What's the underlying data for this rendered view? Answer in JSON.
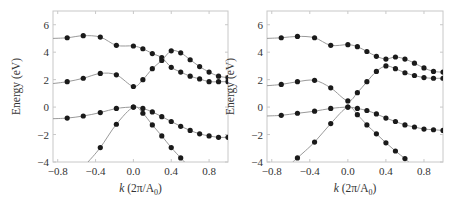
{
  "chart_data": [
    {
      "type": "line",
      "panel": "left",
      "xlabel": "k (2π/A0)",
      "ylabel": "Energy (eV)",
      "xlim": [
        -0.85,
        1.0
      ],
      "ylim": [
        -4,
        7
      ],
      "xticks": [
        -0.8,
        -0.4,
        0.0,
        0.4,
        0.8
      ],
      "xtick_labels": [
        "−0.8",
        "−0.4",
        "0.0",
        "0.4",
        "0.8"
      ],
      "yticks": [
        -4,
        -2,
        0,
        2,
        4,
        6
      ],
      "ytick_labels": [
        "−4",
        "−2",
        "0",
        "2",
        "4",
        "6"
      ],
      "grid": false,
      "series": [
        {
          "name": "band1",
          "line": [
            [
              -0.87,
              5.0
            ],
            [
              -0.7,
              5.05
            ],
            [
              -0.53,
              5.2
            ],
            [
              -0.35,
              5.1
            ],
            [
              -0.18,
              4.5
            ],
            [
              0.0,
              4.45
            ],
            [
              0.1,
              4.25
            ],
            [
              0.2,
              3.9
            ],
            [
              0.3,
              3.6
            ],
            [
              0.4,
              2.9
            ],
            [
              0.5,
              2.55
            ],
            [
              0.6,
              2.25
            ],
            [
              0.7,
              2.05
            ],
            [
              0.8,
              1.85
            ],
            [
              0.9,
              1.85
            ],
            [
              1.0,
              1.85
            ]
          ],
          "points": [
            [
              -0.7,
              5.05
            ],
            [
              -0.53,
              5.2
            ],
            [
              -0.35,
              5.1
            ],
            [
              -0.18,
              4.5
            ],
            [
              0.0,
              4.45
            ],
            [
              0.1,
              4.25
            ],
            [
              0.2,
              3.9
            ],
            [
              0.3,
              3.6
            ],
            [
              0.4,
              2.9
            ],
            [
              0.5,
              2.55
            ],
            [
              0.6,
              2.25
            ],
            [
              0.7,
              2.05
            ],
            [
              0.8,
              1.85
            ],
            [
              0.9,
              1.85
            ],
            [
              1.0,
              1.85
            ]
          ]
        },
        {
          "name": "band2",
          "line": [
            [
              -0.87,
              1.7
            ],
            [
              -0.7,
              1.85
            ],
            [
              -0.53,
              2.1
            ],
            [
              -0.35,
              2.45
            ],
            [
              -0.18,
              2.35
            ],
            [
              0.0,
              1.5
            ],
            [
              0.1,
              2.0
            ],
            [
              0.2,
              2.8
            ],
            [
              0.3,
              3.4
            ],
            [
              0.4,
              4.1
            ],
            [
              0.5,
              3.95
            ],
            [
              0.6,
              3.45
            ],
            [
              0.7,
              2.95
            ],
            [
              0.8,
              2.55
            ],
            [
              0.9,
              2.25
            ],
            [
              1.0,
              2.15
            ]
          ],
          "points": [
            [
              -0.7,
              1.85
            ],
            [
              -0.53,
              2.1
            ],
            [
              -0.35,
              2.45
            ],
            [
              -0.18,
              2.35
            ],
            [
              0.0,
              1.5
            ],
            [
              0.1,
              2.0
            ],
            [
              0.2,
              2.8
            ],
            [
              0.3,
              3.4
            ],
            [
              0.4,
              4.1
            ],
            [
              0.5,
              3.95
            ],
            [
              0.6,
              3.45
            ],
            [
              0.7,
              2.95
            ],
            [
              0.8,
              2.55
            ],
            [
              0.9,
              2.25
            ],
            [
              1.0,
              2.15
            ]
          ]
        },
        {
          "name": "band3",
          "line": [
            [
              -0.87,
              -0.85
            ],
            [
              -0.7,
              -0.8
            ],
            [
              -0.53,
              -0.65
            ],
            [
              -0.35,
              -0.4
            ],
            [
              -0.18,
              -0.1
            ],
            [
              0.0,
              0.0
            ],
            [
              0.1,
              -0.1
            ],
            [
              0.2,
              -0.35
            ],
            [
              0.3,
              -0.7
            ],
            [
              0.4,
              -1.05
            ],
            [
              0.5,
              -1.4
            ],
            [
              0.6,
              -1.7
            ],
            [
              0.7,
              -1.95
            ],
            [
              0.8,
              -2.1
            ],
            [
              0.9,
              -2.2
            ],
            [
              1.0,
              -2.2
            ]
          ],
          "points": [
            [
              -0.7,
              -0.8
            ],
            [
              -0.53,
              -0.65
            ],
            [
              -0.35,
              -0.4
            ],
            [
              -0.18,
              -0.1
            ],
            [
              0.0,
              0.0
            ],
            [
              0.1,
              -0.1
            ],
            [
              0.2,
              -0.35
            ],
            [
              0.3,
              -0.7
            ],
            [
              0.4,
              -1.05
            ],
            [
              0.5,
              -1.4
            ],
            [
              0.6,
              -1.7
            ],
            [
              0.7,
              -1.95
            ],
            [
              0.8,
              -2.1
            ],
            [
              0.9,
              -2.2
            ],
            [
              1.0,
              -2.2
            ]
          ]
        },
        {
          "name": "band4",
          "line": [
            [
              -0.48,
              -4.0
            ],
            [
              -0.35,
              -2.95
            ],
            [
              -0.18,
              -1.25
            ],
            [
              0.0,
              0.0
            ],
            [
              0.1,
              -0.45
            ],
            [
              0.2,
              -1.3
            ],
            [
              0.3,
              -2.1
            ],
            [
              0.4,
              -2.95
            ],
            [
              0.5,
              -3.7
            ],
            [
              0.54,
              -4.0
            ]
          ],
          "points": [
            [
              -0.35,
              -2.95
            ],
            [
              -0.18,
              -1.25
            ],
            [
              0.0,
              0.0
            ],
            [
              0.1,
              -0.45
            ],
            [
              0.2,
              -1.3
            ],
            [
              0.3,
              -2.1
            ],
            [
              0.4,
              -2.95
            ],
            [
              0.5,
              -3.7
            ]
          ]
        }
      ]
    },
    {
      "type": "line",
      "panel": "right",
      "xlabel": "k (2π/A0)",
      "ylabel": "Energy (eV)",
      "xlim": [
        -0.85,
        1.0
      ],
      "ylim": [
        -4,
        7
      ],
      "xticks": [
        -0.8,
        -0.4,
        0.0,
        0.4,
        0.8
      ],
      "xtick_labels": [
        "−0.8",
        "−0.4",
        "0.0",
        "0.4",
        "0.8"
      ],
      "yticks": [
        -4,
        -2,
        0,
        2,
        4,
        6
      ],
      "ytick_labels": [
        "−4",
        "−2",
        "0",
        "2",
        "4",
        "6"
      ],
      "grid": false,
      "series": [
        {
          "name": "band1",
          "line": [
            [
              -0.87,
              5.0
            ],
            [
              -0.7,
              5.05
            ],
            [
              -0.53,
              5.15
            ],
            [
              -0.35,
              5.05
            ],
            [
              -0.18,
              4.5
            ],
            [
              0.0,
              4.55
            ],
            [
              0.1,
              4.4
            ],
            [
              0.2,
              4.05
            ],
            [
              0.3,
              3.7
            ],
            [
              0.4,
              3.5
            ],
            [
              0.5,
              3.65
            ],
            [
              0.6,
              3.5
            ],
            [
              0.7,
              3.2
            ],
            [
              0.8,
              2.85
            ],
            [
              0.9,
              2.6
            ],
            [
              1.0,
              2.55
            ]
          ],
          "points": [
            [
              -0.7,
              5.05
            ],
            [
              -0.53,
              5.15
            ],
            [
              -0.35,
              5.05
            ],
            [
              -0.18,
              4.5
            ],
            [
              0.0,
              4.55
            ],
            [
              0.1,
              4.4
            ],
            [
              0.2,
              4.05
            ],
            [
              0.3,
              3.7
            ],
            [
              0.4,
              3.5
            ],
            [
              0.5,
              3.65
            ],
            [
              0.6,
              3.5
            ],
            [
              0.7,
              3.2
            ],
            [
              0.8,
              2.85
            ],
            [
              0.9,
              2.6
            ],
            [
              1.0,
              2.55
            ]
          ]
        },
        {
          "name": "band2",
          "line": [
            [
              -0.87,
              1.55
            ],
            [
              -0.7,
              1.65
            ],
            [
              -0.53,
              1.85
            ],
            [
              -0.35,
              1.95
            ],
            [
              -0.18,
              1.4
            ],
            [
              0.0,
              0.45
            ],
            [
              0.1,
              1.05
            ],
            [
              0.2,
              1.85
            ],
            [
              0.3,
              2.6
            ],
            [
              0.4,
              3.0
            ],
            [
              0.5,
              2.8
            ],
            [
              0.6,
              2.5
            ],
            [
              0.7,
              2.3
            ],
            [
              0.8,
              2.15
            ],
            [
              0.9,
              2.1
            ],
            [
              1.0,
              2.1
            ]
          ],
          "points": [
            [
              -0.7,
              1.65
            ],
            [
              -0.53,
              1.85
            ],
            [
              -0.35,
              1.95
            ],
            [
              -0.18,
              1.4
            ],
            [
              0.0,
              0.45
            ],
            [
              0.1,
              1.05
            ],
            [
              0.2,
              1.85
            ],
            [
              0.3,
              2.6
            ],
            [
              0.4,
              3.0
            ],
            [
              0.5,
              2.8
            ],
            [
              0.6,
              2.5
            ],
            [
              0.7,
              2.3
            ],
            [
              0.8,
              2.15
            ],
            [
              0.9,
              2.1
            ],
            [
              1.0,
              2.1
            ]
          ]
        },
        {
          "name": "band3",
          "line": [
            [
              -0.87,
              -0.65
            ],
            [
              -0.7,
              -0.6
            ],
            [
              -0.53,
              -0.45
            ],
            [
              -0.35,
              -0.3
            ],
            [
              -0.18,
              -0.1
            ],
            [
              0.0,
              0.0
            ],
            [
              0.1,
              -0.1
            ],
            [
              0.2,
              -0.25
            ],
            [
              0.3,
              -0.5
            ],
            [
              0.4,
              -0.8
            ],
            [
              0.5,
              -1.05
            ],
            [
              0.6,
              -1.3
            ],
            [
              0.7,
              -1.45
            ],
            [
              0.8,
              -1.6
            ],
            [
              0.9,
              -1.65
            ],
            [
              1.0,
              -1.7
            ]
          ],
          "points": [
            [
              -0.7,
              -0.6
            ],
            [
              -0.53,
              -0.45
            ],
            [
              -0.35,
              -0.3
            ],
            [
              -0.18,
              -0.1
            ],
            [
              0.0,
              0.0
            ],
            [
              0.1,
              -0.1
            ],
            [
              0.2,
              -0.25
            ],
            [
              0.3,
              -0.5
            ],
            [
              0.4,
              -0.8
            ],
            [
              0.5,
              -1.05
            ],
            [
              0.6,
              -1.3
            ],
            [
              0.7,
              -1.45
            ],
            [
              0.8,
              -1.6
            ],
            [
              0.9,
              -1.65
            ],
            [
              1.0,
              -1.7
            ]
          ]
        },
        {
          "name": "band4",
          "line": [
            [
              -0.58,
              -4.0
            ],
            [
              -0.53,
              -3.7
            ],
            [
              -0.35,
              -2.55
            ],
            [
              -0.18,
              -1.2
            ],
            [
              0.0,
              0.0
            ],
            [
              0.1,
              -0.55
            ],
            [
              0.2,
              -1.3
            ],
            [
              0.3,
              -1.95
            ],
            [
              0.4,
              -2.6
            ],
            [
              0.5,
              -3.2
            ],
            [
              0.6,
              -3.75
            ],
            [
              0.64,
              -4.0
            ]
          ],
          "points": [
            [
              -0.53,
              -3.7
            ],
            [
              -0.35,
              -2.55
            ],
            [
              -0.18,
              -1.2
            ],
            [
              0.0,
              0.0
            ],
            [
              0.1,
              -0.55
            ],
            [
              0.2,
              -1.3
            ],
            [
              0.3,
              -1.95
            ],
            [
              0.4,
              -2.6
            ],
            [
              0.5,
              -3.2
            ],
            [
              0.6,
              -3.75
            ]
          ]
        }
      ]
    }
  ],
  "panels": [
    {
      "xlabel_k": "k",
      "xlabel_unit": "(2π/A",
      "xlabel_sub": "0",
      "xlabel_close": ")",
      "ylabel": "Energy (eV)"
    },
    {
      "xlabel_k": "k",
      "xlabel_unit": "(2π/A",
      "xlabel_sub": "0",
      "xlabel_close": ")",
      "ylabel": "Energy (eV)"
    }
  ],
  "colors": {
    "line": "#9a9a9a",
    "marker": "#1a1a1a",
    "frame": "#c8c8c8",
    "text": "#333333"
  }
}
